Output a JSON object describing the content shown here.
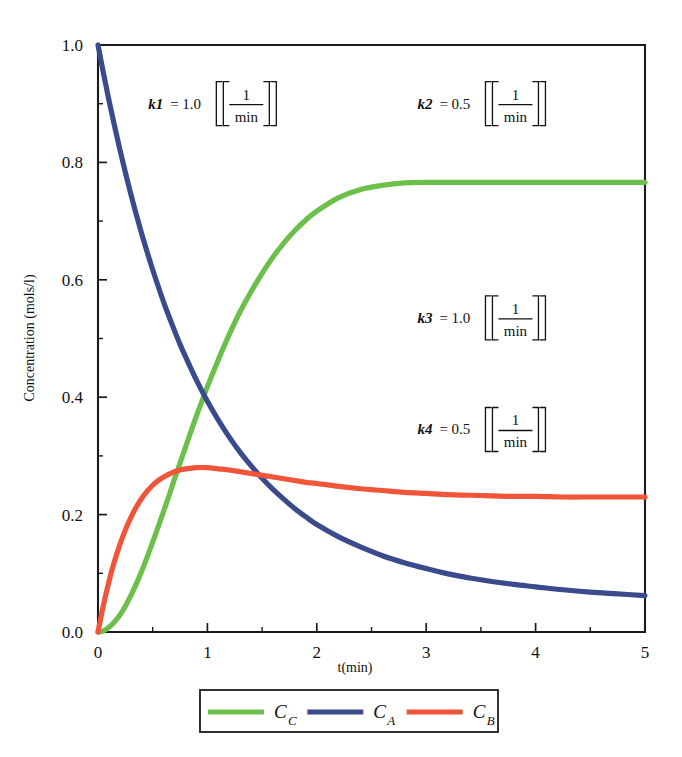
{
  "chart_data": {
    "type": "line",
    "title": "",
    "xlabel": "t(min)",
    "ylabel": "Concentration (mols/l)",
    "xlim": [
      0,
      5
    ],
    "ylim": [
      0,
      1.0
    ],
    "xticks": [
      "0",
      "1",
      "2",
      "3",
      "4",
      "5"
    ],
    "xtick_values": [
      0,
      1,
      2,
      3,
      4,
      5
    ],
    "xminor_values": [
      0.5,
      1.5,
      2.5,
      3.5,
      4.5
    ],
    "yticks": [
      "0.0",
      "0.2",
      "0.4",
      "0.6",
      "0.8",
      "1.0"
    ],
    "ytick_values": [
      0.0,
      0.2,
      0.4,
      0.6,
      0.8,
      1.0
    ],
    "yminor_values": [
      0.1,
      0.3,
      0.5,
      0.7,
      0.9
    ],
    "grid": false,
    "legend_position": "below-axes",
    "x": [
      0,
      0.05,
      0.1,
      0.15,
      0.2,
      0.25,
      0.3,
      0.35,
      0.4,
      0.45,
      0.5,
      0.55,
      0.6,
      0.65,
      0.7,
      0.75,
      0.8,
      0.9,
      1.0,
      1.1,
      1.2,
      1.3,
      1.4,
      1.5,
      1.6,
      1.7,
      1.8,
      1.9,
      2.0,
      2.2,
      2.4,
      2.6,
      2.8,
      3.0,
      3.2,
      3.4,
      3.6,
      3.8,
      4.0,
      4.25,
      4.5,
      4.75,
      5.0
    ],
    "series": [
      {
        "name": "C_C",
        "label_base": "C",
        "label_sub": "C",
        "color": "#6CBF4A",
        "values": [
          0.0,
          0.002,
          0.008,
          0.017,
          0.029,
          0.044,
          0.062,
          0.082,
          0.104,
          0.128,
          0.153,
          0.179,
          0.206,
          0.233,
          0.261,
          0.288,
          0.315,
          0.368,
          0.418,
          0.464,
          0.507,
          0.546,
          0.58,
          0.611,
          0.639,
          0.663,
          0.684,
          0.702,
          0.717,
          0.74,
          0.754,
          0.761,
          0.765,
          0.766,
          0.766,
          0.766,
          0.766,
          0.766,
          0.766,
          0.766,
          0.766,
          0.766,
          0.766
        ]
      },
      {
        "name": "C_A",
        "label_base": "C",
        "label_sub": "A",
        "color": "#3A4A8C",
        "values": [
          1.0,
          0.952,
          0.906,
          0.863,
          0.822,
          0.783,
          0.746,
          0.711,
          0.678,
          0.647,
          0.617,
          0.589,
          0.562,
          0.537,
          0.513,
          0.49,
          0.469,
          0.429,
          0.393,
          0.361,
          0.332,
          0.306,
          0.283,
          0.262,
          0.243,
          0.226,
          0.21,
          0.196,
          0.183,
          0.162,
          0.145,
          0.13,
          0.118,
          0.108,
          0.099,
          0.092,
          0.086,
          0.081,
          0.077,
          0.072,
          0.068,
          0.065,
          0.062
        ]
      },
      {
        "name": "C_B",
        "label_base": "C",
        "label_sub": "B",
        "color": "#F0553A",
        "values": [
          0.0,
          0.046,
          0.086,
          0.12,
          0.149,
          0.174,
          0.195,
          0.213,
          0.228,
          0.24,
          0.25,
          0.258,
          0.264,
          0.269,
          0.273,
          0.276,
          0.278,
          0.28,
          0.28,
          0.278,
          0.276,
          0.273,
          0.27,
          0.267,
          0.264,
          0.261,
          0.258,
          0.255,
          0.253,
          0.248,
          0.244,
          0.241,
          0.238,
          0.236,
          0.234,
          0.233,
          0.232,
          0.231,
          0.231,
          0.23,
          0.23,
          0.23,
          0.23
        ]
      }
    ],
    "annotations": [
      {
        "name": "k1",
        "symbol": "k1",
        "eq": "=",
        "value": "1.0",
        "unit_num": "1",
        "unit_den": "min",
        "x": 0.46,
        "y": 0.9
      },
      {
        "name": "k2",
        "symbol": "k2",
        "eq": "=",
        "value": "0.5",
        "unit_num": "1",
        "unit_den": "min",
        "x": 2.92,
        "y": 0.9
      },
      {
        "name": "k3",
        "symbol": "k3",
        "eq": "=",
        "value": "1.0",
        "unit_num": "1",
        "unit_den": "min",
        "x": 2.92,
        "y": 0.535
      },
      {
        "name": "k4",
        "symbol": "k4",
        "eq": "=",
        "value": "0.5",
        "unit_num": "1",
        "unit_den": "min",
        "x": 2.92,
        "y": 0.345
      }
    ]
  }
}
